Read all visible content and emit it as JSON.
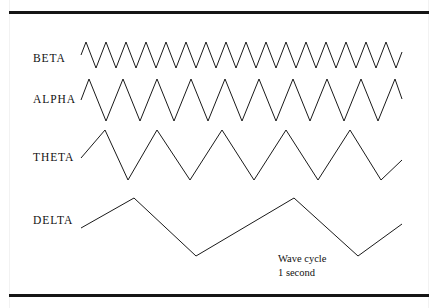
{
  "figure": {
    "background_color": "#ffffff",
    "stroke_color": "#1a1a1a",
    "rule_color": "#151515",
    "width": 438,
    "height": 308
  },
  "caption": {
    "line1": "Wave cycle",
    "line2": "1 second",
    "x": 278,
    "y": 252
  },
  "labels": [
    {
      "name": "beta",
      "text": "BETA",
      "x": 33,
      "y": 53
    },
    {
      "name": "alpha",
      "text": "ALPHA",
      "x": 33,
      "y": 94
    },
    {
      "name": "theta",
      "text": "THETA",
      "x": 33,
      "y": 152
    },
    {
      "name": "delta",
      "text": "DELTA",
      "x": 33,
      "y": 215
    }
  ],
  "chart_data": {
    "type": "line",
    "xlabel": "",
    "ylabel": "",
    "grid": false,
    "legend": "none",
    "annotations": [
      "Wave cycle",
      "1 second"
    ],
    "x_start": 81,
    "x_end": 402,
    "series": [
      {
        "name": "BETA",
        "label": "BETA",
        "cycles": 16,
        "amplitude": 13,
        "baseline_y": 55,
        "relative_frequency": 16,
        "start_phase": "rising",
        "points": [
          [
            81,
            55
          ],
          [
            86,
            42
          ],
          [
            96,
            68
          ],
          [
            106,
            42
          ],
          [
            116,
            68
          ],
          [
            126,
            42
          ],
          [
            136,
            68
          ],
          [
            146,
            42
          ],
          [
            156,
            68
          ],
          [
            166,
            42
          ],
          [
            176,
            68
          ],
          [
            186,
            42
          ],
          [
            196,
            68
          ],
          [
            206,
            42
          ],
          [
            216,
            68
          ],
          [
            226,
            42
          ],
          [
            236,
            68
          ],
          [
            246,
            42
          ],
          [
            256,
            68
          ],
          [
            266,
            42
          ],
          [
            276,
            68
          ],
          [
            286,
            42
          ],
          [
            296,
            68
          ],
          [
            306,
            42
          ],
          [
            316,
            68
          ],
          [
            326,
            42
          ],
          [
            336,
            68
          ],
          [
            346,
            42
          ],
          [
            356,
            68
          ],
          [
            366,
            42
          ],
          [
            376,
            68
          ],
          [
            386,
            42
          ],
          [
            396,
            68
          ],
          [
            402,
            52
          ]
        ]
      },
      {
        "name": "ALPHA",
        "label": "ALPHA",
        "cycles": 9,
        "amplitude": 22,
        "baseline_y": 100,
        "relative_frequency": 9,
        "start_phase": "rising",
        "points": [
          [
            81,
            100
          ],
          [
            89,
            79
          ],
          [
            106,
            121
          ],
          [
            123,
            79
          ],
          [
            140,
            121
          ],
          [
            157,
            79
          ],
          [
            174,
            121
          ],
          [
            191,
            79
          ],
          [
            208,
            121
          ],
          [
            225,
            79
          ],
          [
            242,
            121
          ],
          [
            259,
            79
          ],
          [
            276,
            121
          ],
          [
            293,
            79
          ],
          [
            310,
            121
          ],
          [
            327,
            79
          ],
          [
            344,
            121
          ],
          [
            361,
            79
          ],
          [
            378,
            121
          ],
          [
            395,
            79
          ],
          [
            402,
            99
          ]
        ]
      },
      {
        "name": "THETA",
        "label": "THETA",
        "cycles": 5,
        "amplitude": 33,
        "baseline_y": 155,
        "relative_frequency": 5,
        "start_phase": "rising",
        "points": [
          [
            81,
            158
          ],
          [
            105,
            130
          ],
          [
            128,
            180
          ],
          [
            157,
            130
          ],
          [
            190,
            180
          ],
          [
            222,
            130
          ],
          [
            254,
            180
          ],
          [
            286,
            130
          ],
          [
            318,
            180
          ],
          [
            350,
            130
          ],
          [
            381,
            180
          ],
          [
            402,
            160
          ]
        ]
      },
      {
        "name": "DELTA",
        "label": "DELTA",
        "cycles": 2,
        "amplitude": 28,
        "baseline_y": 225,
        "relative_frequency": 2,
        "start_phase": "rising",
        "points": [
          [
            81,
            228
          ],
          [
            134,
            198
          ],
          [
            196,
            256
          ],
          [
            294,
            198
          ],
          [
            358,
            256
          ],
          [
            402,
            224
          ]
        ]
      }
    ]
  }
}
